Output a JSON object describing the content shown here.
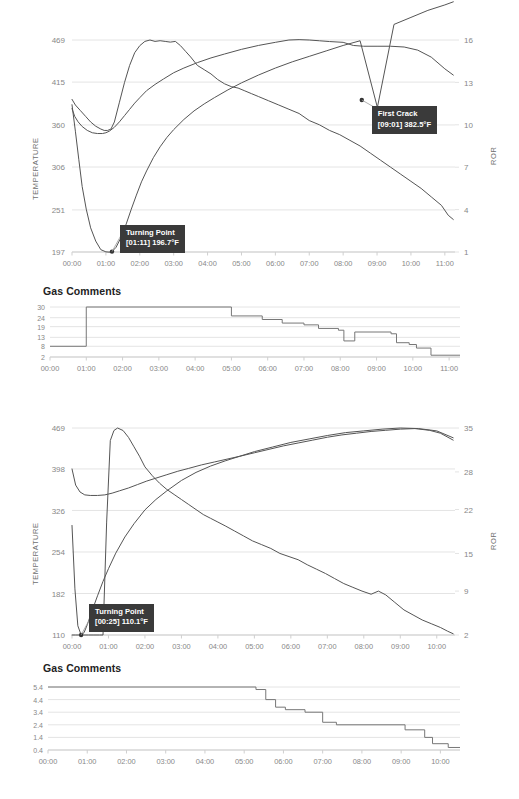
{
  "page": {
    "background": "#ffffff",
    "accent_dark": "#3a3a3a",
    "grid_color": "#e4e4e4",
    "curve_color": "#555555",
    "tick_color": "#888888"
  },
  "roasts": [
    {
      "id": "roast-1",
      "chart_title": "",
      "temperature_axis_label": "TEMPERATURE",
      "ror_axis_label": "ROR",
      "gas_section_title": "Gas Comments",
      "annotations": [
        {
          "name": "turning-point",
          "line1": "Turning Point",
          "line2": "[01:11] 196.7°F",
          "time": "01:11",
          "value": "196.7°F",
          "x_pct": 10.6,
          "y_pct": 97.5
        },
        {
          "name": "first-crack",
          "line1": "First Crack",
          "line2": "[09:01] 382.5°F",
          "time": "09:01",
          "value": "382.5°F",
          "x_pct": 77.3,
          "y_pct": 33.4
        }
      ],
      "chart_data": {
        "type": "line",
        "title": "",
        "xlabel": "",
        "ylabel": "TEMPERATURE",
        "y2label": "ROR",
        "grid": true,
        "legend": "none",
        "x_ticks": [
          "00:00",
          "01:00",
          "02:00",
          "03:00",
          "04:00",
          "05:00",
          "06:00",
          "07:00",
          "08:00",
          "09:00",
          "10:00",
          "11:00"
        ],
        "x_tick_minutes": [
          0,
          1,
          2,
          3,
          4,
          5,
          6,
          7,
          8,
          9,
          10,
          11
        ],
        "xlim": [
          0,
          11.3
        ],
        "y_ticks": [
          197,
          251,
          306,
          360,
          415,
          469
        ],
        "ylim": [
          197,
          469
        ],
        "y2_ticks": [
          1,
          4,
          7,
          10,
          13,
          16
        ],
        "y2lim": [
          1,
          16
        ],
        "series": [
          {
            "name": "bean-temperature",
            "axis": "left",
            "x": [
              0.0,
              0.1,
              0.2,
              0.3,
              0.42,
              0.55,
              0.7,
              0.85,
              1.0,
              1.12,
              1.18,
              1.3,
              1.45,
              1.6,
              1.75,
              1.9,
              2.05,
              2.2,
              2.4,
              2.6,
              2.8,
              3.0,
              3.3,
              3.6,
              3.9,
              4.2,
              4.6,
              5.0,
              5.5,
              6.0,
              6.5,
              7.0,
              7.5,
              8.0,
              8.5,
              9.01,
              9.5,
              10.0,
              10.5,
              11.0,
              11.25
            ],
            "y": [
              386,
              352,
              316,
              281,
              252,
              228,
              211,
              200,
              197.2,
              196.7,
              197.5,
              203,
              216,
              233,
              252,
              270,
              287,
              301,
              318,
              332,
              344,
              354,
              367,
              378,
              387,
              395,
              405,
              414,
              424,
              433,
              441,
              448,
              455,
              462,
              468,
              382.5,
              489,
              498,
              507,
              514,
              518
            ]
          },
          {
            "name": "environmental-temperature",
            "axis": "left",
            "x": [
              0.0,
              0.08,
              0.18,
              0.3,
              0.45,
              0.6,
              0.75,
              0.9,
              1.0,
              1.1,
              1.25,
              1.4,
              1.55,
              1.7,
              1.85,
              2.0,
              2.2,
              2.45,
              2.7,
              3.0,
              3.3,
              3.7,
              4.1,
              4.5,
              5.0,
              5.5,
              6.0,
              6.4,
              6.7,
              7.0,
              7.3,
              7.6,
              8.0,
              8.3,
              8.6,
              9.0,
              9.4,
              9.8,
              10.2,
              10.6,
              11.0,
              11.25
            ],
            "y": [
              381,
              371,
              364,
              358,
              353,
              350,
              349,
              349,
              350,
              352,
              357,
              364,
              372,
              380,
              388,
              395,
              404,
              412,
              419,
              427,
              433,
              440,
              446,
              451,
              457,
              462,
              466,
              469,
              469.5,
              469,
              468,
              467,
              466,
              462,
              461,
              461,
              461,
              460,
              456,
              447,
              432,
              424
            ]
          },
          {
            "name": "rate-of-rise",
            "axis": "right",
            "x": [
              0.0,
              0.1,
              0.25,
              0.4,
              0.55,
              0.7,
              0.85,
              0.95,
              1.05,
              1.15,
              1.25,
              1.4,
              1.55,
              1.7,
              1.85,
              2.0,
              2.15,
              2.3,
              2.45,
              2.6,
              2.75,
              2.9,
              3.05,
              3.2,
              3.35,
              3.5,
              3.7,
              3.9,
              4.1,
              4.3,
              4.5,
              4.7,
              4.9,
              5.1,
              5.3,
              5.5,
              5.8,
              6.1,
              6.4,
              6.7,
              7.0,
              7.3,
              7.6,
              7.9,
              8.2,
              8.5,
              8.8,
              9.1,
              9.4,
              9.7,
              10.0,
              10.3,
              10.6,
              10.9,
              11.1,
              11.25
            ],
            "y": [
              11.8,
              11.4,
              11.0,
              10.6,
              10.2,
              9.9,
              9.7,
              9.6,
              9.6,
              9.7,
              10.2,
              11.6,
              13.0,
              14.2,
              15.1,
              15.6,
              15.9,
              16.0,
              15.9,
              15.95,
              15.9,
              15.85,
              15.9,
              15.6,
              15.2,
              14.8,
              14.2,
              13.9,
              13.6,
              13.2,
              12.9,
              12.7,
              12.6,
              12.4,
              12.2,
              12.0,
              11.7,
              11.4,
              11.1,
              10.8,
              10.3,
              10.0,
              9.6,
              9.3,
              8.9,
              8.5,
              8.0,
              7.5,
              7.0,
              6.5,
              6.0,
              5.5,
              4.9,
              4.3,
              3.6,
              3.3
            ]
          }
        ]
      },
      "gas_chart_data": {
        "type": "line",
        "shape": "step",
        "title": "Gas Comments",
        "xlabel": "",
        "ylabel": "",
        "grid": true,
        "x_ticks": [
          "00:00",
          "01:00",
          "02:00",
          "03:00",
          "04:00",
          "05:00",
          "06:00",
          "07:00",
          "08:00",
          "09:00",
          "10:00",
          "11:00"
        ],
        "xlim": [
          0,
          11.3
        ],
        "y_ticks": [
          2,
          8,
          13,
          19,
          24,
          30
        ],
        "ylim": [
          2,
          30
        ],
        "steps": [
          {
            "t": 0.0,
            "v": 8
          },
          {
            "t": 1.0,
            "v": 30
          },
          {
            "t": 5.0,
            "v": 25
          },
          {
            "t": 5.85,
            "v": 23
          },
          {
            "t": 6.4,
            "v": 21
          },
          {
            "t": 7.0,
            "v": 20
          },
          {
            "t": 7.4,
            "v": 18
          },
          {
            "t": 7.95,
            "v": 17
          },
          {
            "t": 8.1,
            "v": 11
          },
          {
            "t": 8.4,
            "v": 16
          },
          {
            "t": 9.4,
            "v": 15
          },
          {
            "t": 9.55,
            "v": 10
          },
          {
            "t": 9.9,
            "v": 9
          },
          {
            "t": 10.1,
            "v": 7
          },
          {
            "t": 10.5,
            "v": 3
          },
          {
            "t": 11.3,
            "v": 3
          }
        ]
      }
    },
    {
      "id": "roast-2",
      "chart_title": "",
      "temperature_axis_label": "TEMPERATURE",
      "ror_axis_label": "ROR",
      "gas_section_title": "Gas Comments",
      "annotations": [
        {
          "name": "turning-point",
          "line1": "Turning Point",
          "line2": "[00:25] 110.1°F",
          "time": "00:25",
          "value": "110.1°F",
          "x_pct": 4.0,
          "y_pct": 98.0
        }
      ],
      "chart_data": {
        "type": "line",
        "title": "",
        "xlabel": "",
        "ylabel": "TEMPERATURE",
        "y2label": "ROR",
        "grid": true,
        "legend": "none",
        "x_ticks": [
          "00:00",
          "01:00",
          "02:00",
          "03:00",
          "04:00",
          "05:00",
          "06:00",
          "07:00",
          "08:00",
          "09:00",
          "10:00"
        ],
        "x_tick_minutes": [
          0,
          1,
          2,
          3,
          4,
          5,
          6,
          7,
          8,
          9,
          10
        ],
        "xlim": [
          0,
          10.5
        ],
        "y_ticks": [
          110,
          182,
          254,
          326,
          398,
          469
        ],
        "ylim": [
          110,
          469
        ],
        "y2_ticks": [
          2,
          9,
          15,
          22,
          28,
          35
        ],
        "y2lim": [
          2,
          35
        ],
        "series": [
          {
            "name": "bean-temperature",
            "axis": "left",
            "x": [
              0.0,
              0.08,
              0.16,
              0.25,
              0.33,
              0.42,
              0.55,
              0.7,
              0.85,
              1.0,
              1.2,
              1.45,
              1.7,
              2.0,
              2.3,
              2.6,
              3.0,
              3.4,
              3.8,
              4.2,
              4.6,
              5.0,
              5.5,
              6.0,
              6.5,
              7.0,
              7.5,
              8.0,
              8.5,
              9.0,
              9.5,
              10.0,
              10.45
            ],
            "y": [
              300,
              190,
              126,
              110.1,
              114,
              128,
              152,
              178,
              203,
              225,
              252,
              280,
              303,
              327,
              345,
              360,
              378,
              392,
              403,
              412,
              420,
              428,
              436,
              444,
              450,
              456,
              461,
              464,
              467,
              469,
              468,
              464,
              452
            ]
          },
          {
            "name": "environmental-temperature",
            "axis": "left",
            "x": [
              0.0,
              0.1,
              0.22,
              0.35,
              0.5,
              0.7,
              0.9,
              1.1,
              1.3,
              1.55,
              1.8,
              2.05,
              2.3,
              2.6,
              2.9,
              3.2,
              3.55,
              3.9,
              4.25,
              4.6,
              5.0,
              5.4,
              5.8,
              6.2,
              6.6,
              7.0,
              7.4,
              7.8,
              8.2,
              8.6,
              9.0,
              9.4,
              9.8,
              10.1,
              10.45
            ],
            "y": [
              398,
              370,
              358,
              353,
              352,
              352,
              353,
              356,
              360,
              365,
              371,
              377,
              382,
              388,
              394,
              399,
              405,
              410,
              415,
              420,
              426,
              432,
              438,
              443,
              448,
              453,
              457,
              460,
              463,
              465,
              467,
              468,
              465,
              460,
              448
            ]
          },
          {
            "name": "rate-of-rise",
            "axis": "right",
            "x": [
              0.0,
              0.1,
              0.22,
              0.33,
              0.45,
              0.6,
              0.75,
              0.85,
              0.95,
              1.05,
              1.15,
              1.25,
              1.4,
              1.55,
              1.7,
              1.85,
              2.0,
              2.2,
              2.4,
              2.6,
              2.8,
              3.0,
              3.2,
              3.4,
              3.6,
              3.8,
              4.0,
              4.2,
              4.45,
              4.7,
              4.95,
              5.2,
              5.45,
              5.7,
              5.95,
              6.2,
              6.45,
              6.7,
              6.95,
              7.2,
              7.45,
              7.7,
              7.95,
              8.2,
              8.4,
              8.6,
              8.85,
              9.1,
              9.35,
              9.6,
              9.85,
              10.1,
              10.3,
              10.45
            ],
            "y": [
              2.0,
              2.0,
              2.0,
              2.0,
              2.0,
              2.0,
              2.0,
              2.0,
              20.0,
              33.0,
              34.6,
              35.0,
              34.6,
              33.5,
              32.0,
              30.5,
              28.8,
              27.4,
              26.2,
              25.2,
              24.4,
              23.6,
              22.8,
              22.0,
              21.2,
              20.6,
              20.0,
              19.4,
              18.6,
              17.8,
              17.0,
              16.4,
              15.8,
              15.0,
              14.5,
              14.0,
              13.2,
              12.5,
              11.8,
              11.0,
              10.2,
              9.6,
              9.0,
              8.5,
              9.0,
              8.4,
              7.2,
              6.0,
              5.2,
              4.4,
              3.8,
              3.2,
              2.6,
              2.2
            ]
          }
        ]
      },
      "gas_chart_data": {
        "type": "line",
        "shape": "step",
        "title": "Gas Comments",
        "xlabel": "",
        "ylabel": "",
        "grid": true,
        "x_ticks": [
          "00:00",
          "01:00",
          "02:00",
          "03:00",
          "04:00",
          "05:00",
          "06:00",
          "07:00",
          "08:00",
          "09:00",
          "10:00"
        ],
        "xlim": [
          0,
          10.5
        ],
        "y_ticks": [
          0.4,
          1.4,
          2.4,
          3.4,
          4.4,
          5.4
        ],
        "ylim": [
          0.4,
          5.4
        ],
        "steps": [
          {
            "t": 0.0,
            "v": 5.4
          },
          {
            "t": 5.3,
            "v": 5.2
          },
          {
            "t": 5.55,
            "v": 4.4
          },
          {
            "t": 5.8,
            "v": 3.8
          },
          {
            "t": 6.05,
            "v": 3.6
          },
          {
            "t": 6.55,
            "v": 3.4
          },
          {
            "t": 7.0,
            "v": 2.6
          },
          {
            "t": 7.35,
            "v": 2.4
          },
          {
            "t": 9.1,
            "v": 2.0
          },
          {
            "t": 9.6,
            "v": 1.4
          },
          {
            "t": 9.8,
            "v": 0.9
          },
          {
            "t": 10.2,
            "v": 0.6
          },
          {
            "t": 10.5,
            "v": 0.6
          }
        ]
      }
    }
  ]
}
